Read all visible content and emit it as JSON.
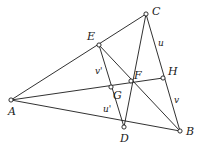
{
  "figure": {
    "kind": "geometry-diagram",
    "width": 204,
    "height": 148,
    "background_color": "#ffffff",
    "stroke_color": "#1a1a1a",
    "vertices": [
      {
        "id": "A",
        "label": "A",
        "x": 11,
        "y": 100,
        "label_x": 8,
        "label_y": 106
      },
      {
        "id": "B",
        "label": "B",
        "x": 180,
        "y": 131,
        "label_x": 186,
        "label_y": 126
      },
      {
        "id": "C",
        "label": "C",
        "x": 146,
        "y": 14,
        "label_x": 152,
        "label_y": 6
      },
      {
        "id": "D",
        "label": "D",
        "x": 124,
        "y": 127,
        "label_x": 120,
        "label_y": 133
      },
      {
        "id": "E",
        "label": "E",
        "x": 99,
        "y": 45,
        "label_x": 87,
        "label_y": 31
      },
      {
        "id": "F",
        "label": "F",
        "x": 131,
        "y": 81,
        "label_x": 134,
        "label_y": 70
      },
      {
        "id": "G",
        "label": "G",
        "x": 111,
        "y": 87,
        "label_x": 113,
        "label_y": 90
      },
      {
        "id": "H",
        "label": "H",
        "x": 163,
        "y": 78,
        "label_x": 168,
        "label_y": 66
      }
    ],
    "edges": [
      {
        "id": "A-C",
        "from": "A",
        "to": "C",
        "via": [
          "E"
        ]
      },
      {
        "id": "A-B",
        "from": "A",
        "to": "B",
        "via": [
          "D"
        ]
      },
      {
        "id": "A-H",
        "from": "A",
        "to": "H",
        "via": [
          "G",
          "F"
        ]
      },
      {
        "id": "C-D",
        "from": "C",
        "to": "D",
        "via": [
          "F"
        ]
      },
      {
        "id": "C-B",
        "from": "C",
        "to": "B",
        "via": [
          "H"
        ]
      },
      {
        "id": "E-B",
        "from": "E",
        "to": "B",
        "via": [
          "F"
        ]
      },
      {
        "id": "E-D",
        "from": "E",
        "to": "D",
        "via": [
          "G"
        ]
      }
    ],
    "segment_labels": [
      {
        "id": "u",
        "label": "u",
        "on_edge": "C-H",
        "x": 158,
        "y": 39
      },
      {
        "id": "v",
        "label": "v",
        "on_edge": "H-B",
        "x": 174,
        "y": 96
      },
      {
        "id": "v-prime",
        "label": "v'",
        "on_edge": "E-G",
        "x": 95,
        "y": 67
      },
      {
        "id": "u-prime",
        "label": "u'",
        "on_edge": "G-D",
        "x": 103,
        "y": 105
      }
    ]
  }
}
